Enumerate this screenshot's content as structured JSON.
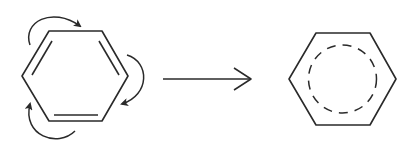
{
  "diagram": {
    "type": "chemical-resonance",
    "colors": {
      "background": "#ffffff",
      "stroke": "#2a2a2a"
    },
    "nodes": [
      {
        "id": "kekule-benzene",
        "label": "",
        "shape": "hexagon",
        "double_bonds": 3,
        "curved_arrows": 3
      },
      {
        "id": "delocalized-benzene",
        "label": "",
        "shape": "hexagon",
        "inner": "dashed-circle"
      }
    ],
    "edges": [
      {
        "from": "kekule-benzene",
        "to": "delocalized-benzene",
        "style": "open-arrow",
        "label": ""
      }
    ]
  }
}
